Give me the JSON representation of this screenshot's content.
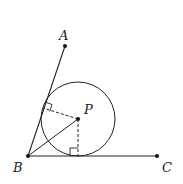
{
  "diagram": {
    "type": "geometry",
    "points": {
      "A": {
        "label": "A",
        "x": 65,
        "y": 46
      },
      "B": {
        "label": "B",
        "x": 28,
        "y": 156
      },
      "C": {
        "label": "C",
        "x": 157,
        "y": 156
      },
      "P": {
        "label": "P",
        "x": 78,
        "y": 119
      }
    },
    "circle": {
      "center": "P",
      "r": 37
    },
    "segments": [
      "BA",
      "BC",
      "BP"
    ],
    "dashed_segments": [
      "P-footAB",
      "P-footBC"
    ],
    "right_angle_marks": 2,
    "colors": {
      "stroke": "#222222",
      "background": "#ffffff"
    }
  }
}
